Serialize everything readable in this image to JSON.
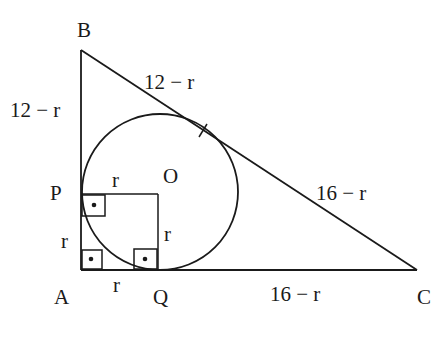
{
  "diagram": {
    "type": "geometry",
    "vertices": {
      "A": "A",
      "B": "B",
      "C": "C",
      "P": "P",
      "Q": "Q",
      "O": "O"
    },
    "labels": {
      "AB_upper": "12 − r",
      "BC_upper": "12 − r",
      "BC_lower": "16 − r",
      "QC": "16 − r",
      "AP": "r",
      "AQ": "r",
      "PO": "r",
      "OQ": "r"
    },
    "right_angle_markers": [
      "A",
      "P",
      "Q"
    ],
    "tangent_tick_on": "BC",
    "colors": {
      "ink": "#1a1a1a",
      "background": "#ffffff"
    }
  }
}
